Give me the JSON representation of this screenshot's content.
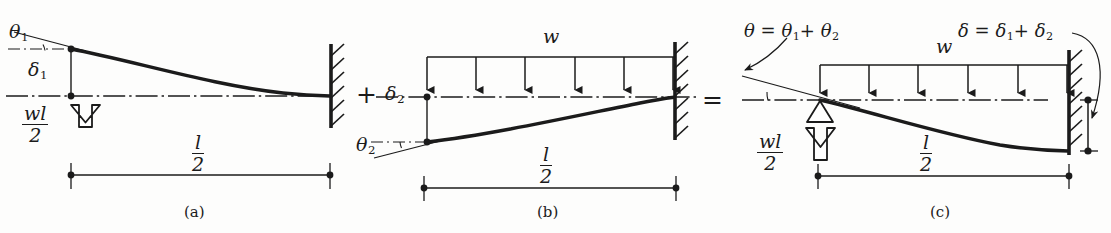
{
  "figure": {
    "type": "engineering-beam-diagram",
    "ink_color": "#1b1b1b",
    "background": "#fdfdfc"
  },
  "operators": {
    "plus": "+",
    "equals": "="
  },
  "panels": [
    {
      "id": "a",
      "caption": "(a)",
      "span_label": {
        "num": "l",
        "den": "2"
      },
      "reaction_label": {
        "num": "wl",
        "den": "2"
      },
      "angle_label": {
        "sym": "θ",
        "sub": "1"
      },
      "deflection_label": {
        "sym": "δ",
        "sub": "1"
      },
      "support": "fixed-hatched",
      "load_type": "end-point-upward",
      "curve": "deflects upward at free end, tangent at fixed end"
    },
    {
      "id": "b",
      "caption": "(b)",
      "span_label": {
        "num": "l",
        "den": "2"
      },
      "distributed_load_label": "w",
      "distributed_arrow_count": 6,
      "angle_label": {
        "sym": "θ",
        "sub": "2"
      },
      "deflection_label": {
        "sym": "δ",
        "sub": "2"
      },
      "support": "fixed-hatched",
      "load_type": "uniformly-distributed-downward",
      "curve": "deflects downward at free end, tangent at fixed end"
    },
    {
      "id": "c",
      "caption": "(c)",
      "span_label": {
        "num": "l",
        "den": "2"
      },
      "reaction_label": {
        "num": "wl",
        "den": "2"
      },
      "distributed_load_label": "w",
      "distributed_arrow_count": 6,
      "support": "fixed-hatched",
      "pin_support": "hollow-triangle",
      "load_type": "combined",
      "theta_equation": {
        "lhs": "θ",
        "eq": "=",
        "t1": "θ",
        "s1": "1",
        "plus": "+",
        "t2": "θ",
        "s2": "2"
      },
      "delta_equation": {
        "lhs": "δ",
        "eq": "=",
        "d1": "δ",
        "s1": "1",
        "plus": "+",
        "d2": "δ",
        "s2": "2"
      },
      "curve": "net downward deflection at fixed end"
    }
  ]
}
